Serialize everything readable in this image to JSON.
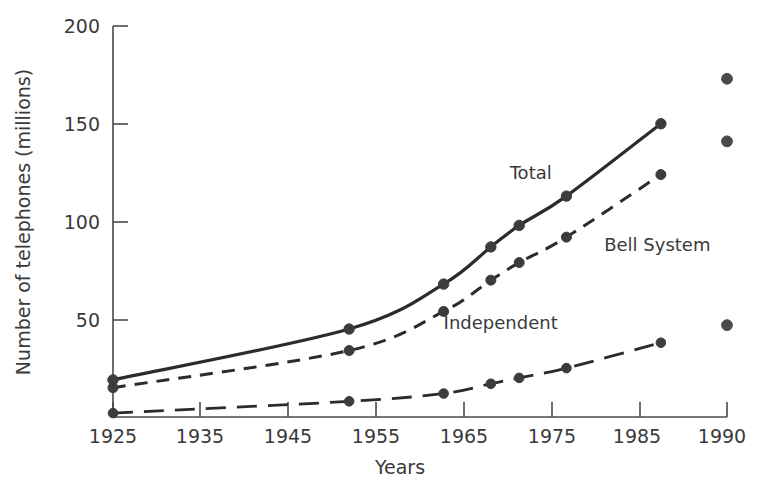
{
  "chart_data": {
    "type": "line",
    "title": "",
    "xlabel": "Years",
    "ylabel": "Number of telephones (millions)",
    "xlim": [
      1925,
      1990
    ],
    "ylim": [
      0,
      200
    ],
    "xticks": [
      "1925",
      "1935",
      "1945",
      "1955",
      "1965",
      "1975",
      "1985",
      "1990"
    ],
    "xtick_values": [
      1925,
      1935,
      1945,
      1955,
      1965,
      1975,
      1985,
      1990
    ],
    "yticks": [
      "50",
      "100",
      "150",
      "200"
    ],
    "ytick_values": [
      50,
      100,
      150,
      200
    ],
    "grid": false,
    "legend_position": "inline-annotations",
    "series": [
      {
        "name": "Total",
        "style": "solid",
        "label": "Total",
        "label_x": 1967,
        "label_y": 122,
        "x": [
          1925,
          1950,
          1960,
          1965,
          1968,
          1973,
          1983
        ],
        "values": [
          19,
          45,
          68,
          87,
          98,
          113,
          150
        ]
      },
      {
        "name": "Bell System",
        "style": "dashed",
        "label": "Bell System",
        "label_x": 1977,
        "label_y": 85,
        "x": [
          1925,
          1950,
          1960,
          1965,
          1968,
          1973,
          1983
        ],
        "values": [
          15,
          34,
          54,
          70,
          79,
          92,
          124
        ]
      },
      {
        "name": "Independent",
        "style": "long-dashed",
        "label": "Independent",
        "label_x": 1960,
        "label_y": 45,
        "x": [
          1925,
          1950,
          1960,
          1965,
          1968,
          1973,
          1983
        ],
        "values": [
          2,
          8,
          12,
          17,
          20,
          25,
          38
        ]
      }
    ],
    "isolated_points": [
      {
        "x": 1990,
        "y": 173,
        "series": "Total"
      },
      {
        "x": 1990,
        "y": 141,
        "series": "Bell System"
      },
      {
        "x": 1990,
        "y": 47,
        "series": "Independent"
      }
    ],
    "colors": {
      "line": "#2b2b2b",
      "axis": "#4a4a4a",
      "text": "#3a3a3a",
      "background": "#ffffff"
    }
  }
}
